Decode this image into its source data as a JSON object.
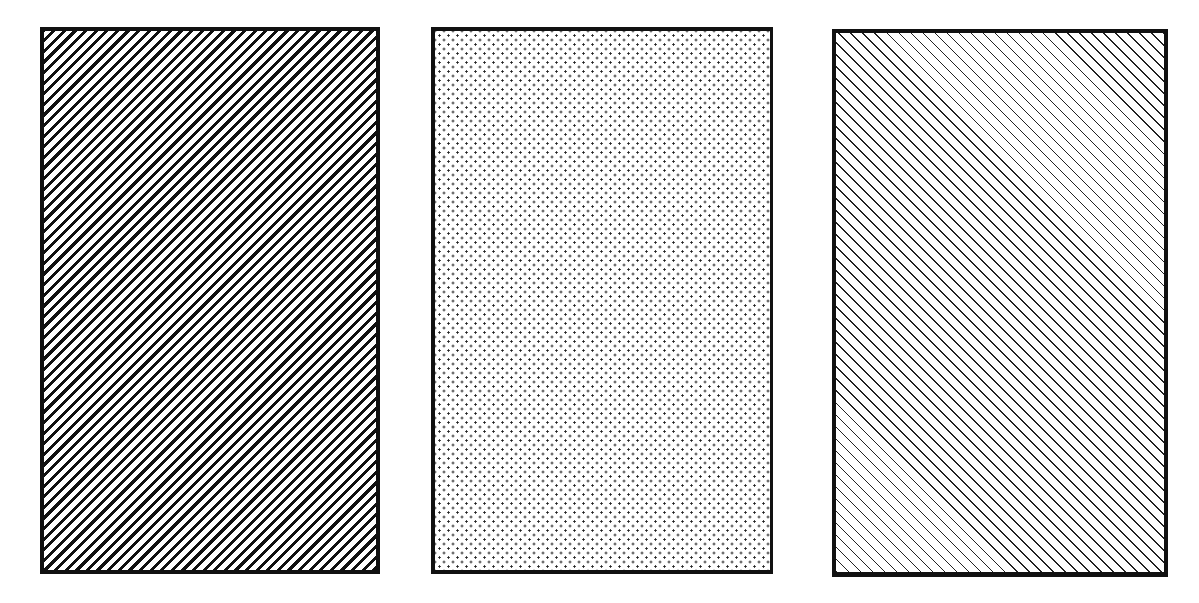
{
  "panels": [
    {
      "id": "p1",
      "pattern": "thick-diagonal-hatch-up-right",
      "line_color": "#111111",
      "border_color": "#111111"
    },
    {
      "id": "p2",
      "pattern": "staggered-dot-grid",
      "dot_color": "#222222",
      "border_color": "#111111"
    },
    {
      "id": "p3",
      "pattern": "thin-diagonal-hatch-down-right",
      "line_color": "#222222",
      "border_color": "#111111"
    }
  ]
}
